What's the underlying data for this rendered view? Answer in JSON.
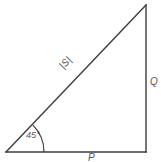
{
  "diagram": {
    "kind": "right-triangle-vector-diagram",
    "background_color": "#ffffff",
    "stroke_color": "#3c3d40",
    "label_color": "#55565a",
    "geometry": {
      "vertex_bottom_left": [
        6,
        152
      ],
      "vertex_bottom_right": [
        146,
        152
      ],
      "vertex_top_right": [
        146,
        5
      ],
      "arc_radius": 38,
      "arc_center": [
        6,
        152
      ]
    },
    "labels": {
      "hypotenuse": "|S|",
      "vertical_side": "Q",
      "base_side": "P",
      "angle": "45°"
    }
  }
}
